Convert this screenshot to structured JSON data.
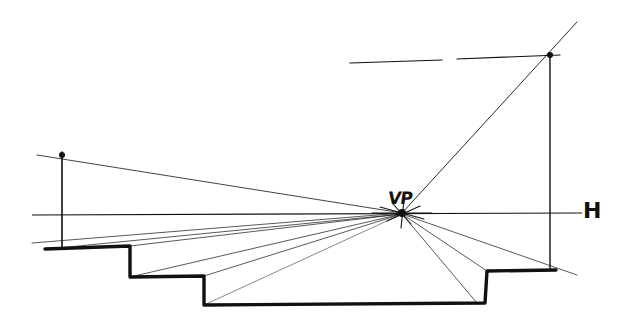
{
  "diagram": {
    "labels": {
      "vanishing_point": "VP",
      "horizon_line": "H"
    },
    "colors": {
      "ink": "#111111",
      "paper": "#ffffff",
      "light_ink": "#444444"
    },
    "vanishing_point": {
      "x": 402,
      "y": 213
    },
    "horizon_line": {
      "x1": 32,
      "y1": 215,
      "x2": 582,
      "y2": 213
    },
    "section_profile": [
      [
        45,
        249
      ],
      [
        130,
        246
      ],
      [
        130,
        277
      ],
      [
        204,
        276
      ],
      [
        204,
        305
      ],
      [
        485,
        303
      ],
      [
        487,
        271
      ],
      [
        556,
        270
      ]
    ],
    "construction_lines": [
      {
        "x1": 37,
        "y1": 155,
        "x2": 402,
        "y2": 213,
        "weight": 0.8
      },
      {
        "x1": 62,
        "y1": 152,
        "x2": 62,
        "y2": 247,
        "weight": 1.6
      },
      {
        "x1": 32,
        "y1": 243,
        "x2": 402,
        "y2": 213,
        "weight": 0.7
      },
      {
        "x1": 48,
        "y1": 249,
        "x2": 402,
        "y2": 214,
        "weight": 0.7
      },
      {
        "x1": 130,
        "y1": 246,
        "x2": 402,
        "y2": 214,
        "weight": 0.7
      },
      {
        "x1": 130,
        "y1": 277,
        "x2": 402,
        "y2": 214,
        "weight": 0.7
      },
      {
        "x1": 204,
        "y1": 276,
        "x2": 402,
        "y2": 214,
        "weight": 0.7
      },
      {
        "x1": 204,
        "y1": 305,
        "x2": 402,
        "y2": 214,
        "weight": 0.5
      },
      {
        "x1": 477,
        "y1": 303,
        "x2": 402,
        "y2": 214,
        "weight": 0.7
      },
      {
        "x1": 487,
        "y1": 271,
        "x2": 402,
        "y2": 214,
        "weight": 0.7
      },
      {
        "x1": 577,
        "y1": 275,
        "x2": 402,
        "y2": 214,
        "weight": 0.7
      },
      {
        "x1": 402,
        "y1": 213,
        "x2": 577,
        "y2": 22,
        "weight": 0.9
      },
      {
        "x1": 550,
        "y1": 55,
        "x2": 550,
        "y2": 270,
        "weight": 1.4
      },
      {
        "x1": 350,
        "y1": 63,
        "x2": 442,
        "y2": 60,
        "weight": 1.2
      },
      {
        "x1": 457,
        "y1": 59,
        "x2": 560,
        "y2": 55,
        "weight": 1.2
      }
    ],
    "burst_lines": [
      {
        "x1": 380,
        "y1": 207,
        "x2": 424,
        "y2": 219
      },
      {
        "x1": 387,
        "y1": 221,
        "x2": 420,
        "y2": 206
      },
      {
        "x1": 393,
        "y1": 204,
        "x2": 411,
        "y2": 224
      },
      {
        "x1": 404,
        "y1": 200,
        "x2": 401,
        "y2": 228
      },
      {
        "x1": 372,
        "y1": 213,
        "x2": 432,
        "y2": 213
      }
    ],
    "markers": [
      {
        "x": 62,
        "y": 155,
        "r": 3
      },
      {
        "x": 550,
        "y": 55,
        "r": 3
      },
      {
        "x": 402,
        "y": 213,
        "r": 4
      }
    ]
  }
}
